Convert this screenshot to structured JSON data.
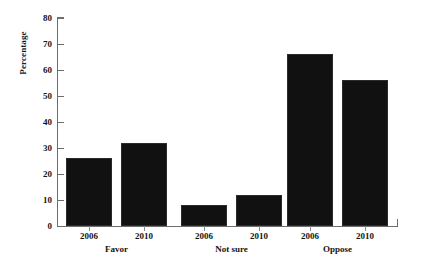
{
  "chart_data": {
    "type": "bar",
    "title": "",
    "xlabel": "",
    "ylabel": "Percentage",
    "ylim": [
      0,
      80
    ],
    "yticks": [
      0,
      10,
      20,
      30,
      40,
      50,
      60,
      70,
      80
    ],
    "ytick_labels": [
      "0",
      "10",
      "20",
      "30",
      "40",
      "50",
      "60",
      "70",
      "80"
    ],
    "grid": false,
    "legend": null,
    "groups": [
      "Favor",
      "Not sure",
      "Oppose"
    ],
    "categories": [
      "2006",
      "2010",
      "2006",
      "2010",
      "2006",
      "2010"
    ],
    "values": [
      26,
      32,
      8,
      12,
      66,
      56
    ],
    "bars": [
      {
        "group": "Favor",
        "year": "2006",
        "value": 26
      },
      {
        "group": "Favor",
        "year": "2010",
        "value": 32
      },
      {
        "group": "Not sure",
        "year": "2006",
        "value": 8
      },
      {
        "group": "Not sure",
        "year": "2010",
        "value": 12
      },
      {
        "group": "Oppose",
        "year": "2006",
        "value": 66
      },
      {
        "group": "Oppose",
        "year": "2010",
        "value": 56
      }
    ],
    "colors": {
      "bar_fill": "#111111",
      "bar_edge": "#2b2b2b",
      "axis": "#6e6e6e",
      "text": "#141414",
      "background": "#ffffff"
    }
  }
}
